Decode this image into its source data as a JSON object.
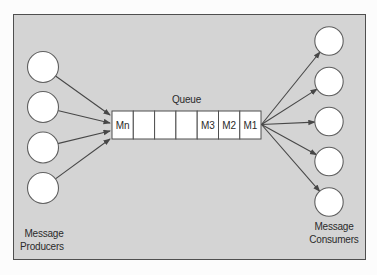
{
  "diagram": {
    "queue": {
      "label": "Queue",
      "cells": [
        "Mn",
        "",
        "",
        "",
        "M3",
        "M2",
        "M1"
      ]
    },
    "producers": {
      "count": 4,
      "label_line1": "Message",
      "label_line2": "Producers"
    },
    "consumers": {
      "count": 5,
      "label_line1": "Message",
      "label_line2": "Consumers"
    },
    "colors": {
      "page_bg": "#fcfcfc",
      "panel_bg": "#d4d4d4",
      "panel_border": "#4f4f4f",
      "node_fill": "#ffffff",
      "node_stroke": "#5f5f5f",
      "cell_fill": "#ffffff",
      "cell_border": "#4f4f4f",
      "arrow": "#474747",
      "text": "#2b2b2b"
    }
  }
}
